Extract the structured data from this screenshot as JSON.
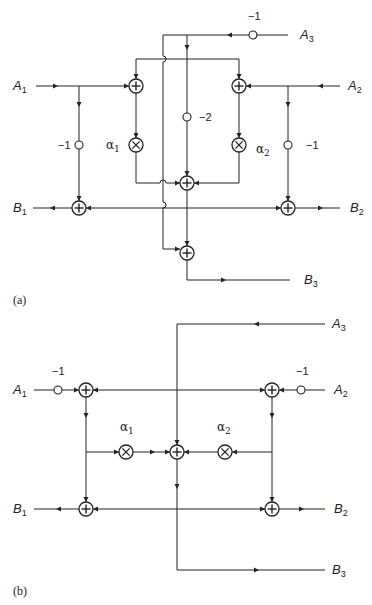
{
  "diagram_a": {
    "caption": "(a)",
    "inputs": [
      {
        "name": "A",
        "sub": "1"
      },
      {
        "name": "A",
        "sub": "2"
      },
      {
        "name": "A",
        "sub": "3"
      }
    ],
    "outputs": [
      {
        "name": "B",
        "sub": "1"
      },
      {
        "name": "B",
        "sub": "2"
      },
      {
        "name": "B",
        "sub": "3"
      }
    ],
    "gains": {
      "a3": "−1",
      "center": "−2",
      "left": "−1",
      "right": "−1"
    },
    "multipliers": [
      {
        "name": "α",
        "sub": "1"
      },
      {
        "name": "α",
        "sub": "2"
      }
    ]
  },
  "diagram_b": {
    "caption": "(b)",
    "inputs": [
      {
        "name": "A",
        "sub": "1"
      },
      {
        "name": "A",
        "sub": "2"
      },
      {
        "name": "A",
        "sub": "3"
      }
    ],
    "outputs": [
      {
        "name": "B",
        "sub": "1"
      },
      {
        "name": "B",
        "sub": "2"
      },
      {
        "name": "B",
        "sub": "3"
      }
    ],
    "gains": {
      "left": "−1",
      "right": "−1"
    },
    "multipliers": [
      {
        "name": "α",
        "sub": "1"
      },
      {
        "name": "α",
        "sub": "2"
      }
    ]
  },
  "symbols": {
    "plus": "+",
    "times": "×"
  }
}
